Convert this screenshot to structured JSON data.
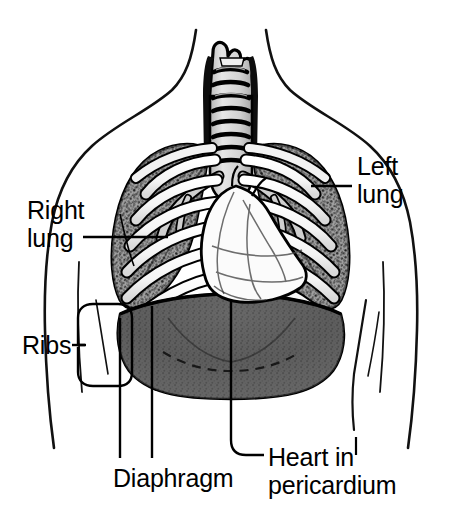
{
  "figure": {
    "width": 460,
    "height": 518,
    "background_color": "#ffffff",
    "ink_color": "#000000",
    "style": "black-and-white line drawing with stippled halftone shading"
  },
  "labels": {
    "right_lung": "Right\nlung",
    "left_lung": "Left\nlung",
    "ribs": "Ribs",
    "diaphragm": "Diaphragm",
    "heart_in_pericardium": "Heart in\npericardium"
  },
  "structures": [
    {
      "name": "torso-outline",
      "label": null,
      "description": "neck, shoulders and upper arms silhouette",
      "fill": "#ffffff",
      "stroke": "#000000"
    },
    {
      "name": "trachea",
      "label": null,
      "description": "larynx and cartilage-ringed windpipe descending to carina",
      "fill": "#d8d8d8",
      "stroke": "#000000"
    },
    {
      "name": "bronchi",
      "label": null,
      "description": "primary bronchi branching left and right from the carina",
      "fill": "#d0d0d0",
      "stroke": "#000000"
    },
    {
      "name": "right-lung",
      "label": "Right lung",
      "description": "stippled gray lung tissue on the viewer's left",
      "fill": "#9a9a9a",
      "stroke": "#000000"
    },
    {
      "name": "left-lung",
      "label": "Left lung",
      "description": "stippled gray lung tissue on the viewer's right",
      "fill": "#9a9a9a",
      "stroke": "#000000"
    },
    {
      "name": "ribs",
      "label": "Ribs",
      "description": "white rib bands with black outlines curving over the lungs",
      "fill": "#ffffff",
      "stroke": "#000000"
    },
    {
      "name": "heart-in-pericardium",
      "label": "Heart in pericardium",
      "description": "white heart silhouette centered low between the lungs",
      "fill": "#fbfbfb",
      "stroke": "#000000"
    },
    {
      "name": "diaphragm",
      "label": "Diaphragm",
      "description": "dark gray dome beneath the lungs spanning the rib cage",
      "fill": "#5f5f5f",
      "stroke": "#000000"
    }
  ],
  "leaders": [
    {
      "name": "right-lung-leader",
      "from": "Right lung",
      "shape": "horizontal-line"
    },
    {
      "name": "left-lung-leader",
      "from": "Left lung",
      "shape": "horizontal-line"
    },
    {
      "name": "ribs-leader",
      "from": "Ribs",
      "shape": "rounded-bracket-with-stem"
    },
    {
      "name": "diaphragm-leader",
      "from": "Diaphragm",
      "shape": "two-vertical-lines"
    },
    {
      "name": "heart-leader",
      "from": "Heart in pericardium",
      "shape": "elbow-line"
    }
  ]
}
